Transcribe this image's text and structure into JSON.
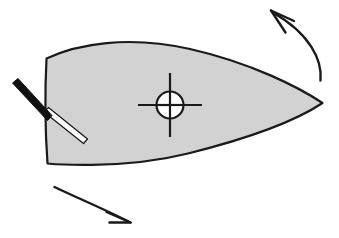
{
  "figure": {
    "background_color": "#ffffff",
    "width": 339,
    "height": 238
  },
  "hull": {
    "name": "boat-hull",
    "description": "Leaf-shaped hull seen from above, pointed bow at right, flat transom at left",
    "fill_color": "#d2d2d2",
    "stroke_color": "#1a1a1a",
    "stroke_width": 2.2,
    "path": "M 46.5 58.5 C 44.8 92.0 45.2 131.0 47.5 163.5 C 47.5 163.5 120.0 170.5 188.0 153.5 C 256.0 136.5 300.0 118.0 322.5 103.0 C 300.0 88.0 252.0 63.0 190.0 49.0 C 128.0 35.0 77.0 44.0 46.5 58.5 Z",
    "bow_tip": {
      "x": 323,
      "y": 103
    },
    "stern_top": {
      "x": 46,
      "y": 58
    },
    "stern_bottom": {
      "x": 48,
      "y": 164
    }
  },
  "tiller": {
    "name": "tiller-assembly",
    "handle": {
      "label": "tiller-handle",
      "fill_color": "#111111",
      "stroke_color": "#111111",
      "path": "M 12.5 83.0 L 18.0 78.5 L 52.0 115.5 L 47.5 120.5 Z"
    },
    "rod": {
      "label": "rudder-stock-rod",
      "fill_color": "#fbfbfb",
      "stroke_color": "#151515",
      "stroke_width": 1.2,
      "path": "M 44.0 112.0 L 48.5 107.5 L 87.5 139.0 L 83.5 143.5 Z"
    }
  },
  "center_marker": {
    "name": "center-of-gravity-marker",
    "center": {
      "x": 170,
      "y": 105
    },
    "radius": 13.5,
    "stroke_color": "#1a1a1a",
    "stroke_width": 2.2,
    "fill_color": "#ffffff",
    "crosshair": {
      "vertical": {
        "x": 170,
        "y1": 73,
        "y2": 137
      },
      "horizontal": {
        "y": 105,
        "x1": 138,
        "x2": 202
      }
    }
  },
  "arrows": [
    {
      "name": "yaw-arrow-upper",
      "direction": "counterclockwise-up-left",
      "stroke_color": "#1a1a1a",
      "stroke_width": 2.4,
      "curve": "M 320.5 80.5 C 322.5 60.0 310.0 34.0 273.0 12.5",
      "barbs": [
        "M 271.0 10.5 L 294.0 21.0",
        "M 271.0 10.5 L 285.5 32.5"
      ]
    },
    {
      "name": "yaw-arrow-lower",
      "direction": "clockwise-down-right",
      "stroke_color": "#1a1a1a",
      "stroke_width": 2.4,
      "curve": "M 54.5 187.0 C 73.0 196.0 104.0 209.0 128.5 221.5",
      "barbs": [
        "M 130.5 222.5 L 106.5 212.0",
        "M 130.5 222.5 L 109.5 222.5"
      ]
    }
  ]
}
